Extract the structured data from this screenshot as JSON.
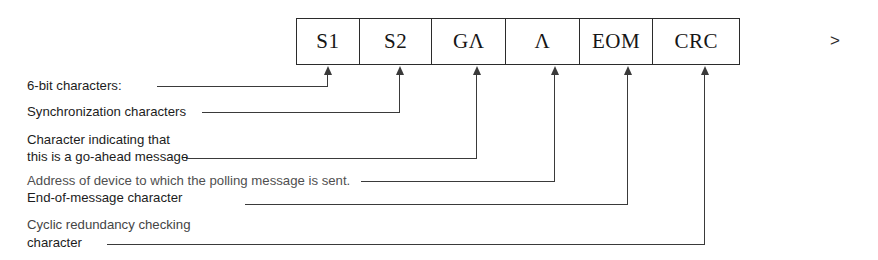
{
  "diagram": {
    "continuation_marker": ">",
    "frame": {
      "cells": [
        {
          "label": "S1",
          "name": "cell-s1"
        },
        {
          "label": "S2",
          "name": "cell-s2"
        },
        {
          "label": "GΛ",
          "name": "cell-ga"
        },
        {
          "label": "Λ",
          "name": "cell-a"
        },
        {
          "label": "EOM",
          "name": "cell-eom"
        },
        {
          "label": "CRC",
          "name": "cell-crc"
        }
      ]
    },
    "annotations": [
      {
        "id": "six-bit-characters",
        "lines": [
          "6-bit characters:"
        ],
        "target_cell": "S1"
      },
      {
        "id": "synchronization-characters",
        "lines": [
          "Synchronization characters"
        ],
        "target_cell": "S2"
      },
      {
        "id": "go-ahead-character",
        "lines": [
          "Character indicating that",
          "this is a go-ahead message"
        ],
        "target_cell": "GΛ"
      },
      {
        "id": "address-of-device",
        "lines": [
          "Address of device to which the polling message is sent."
        ],
        "target_cell": "Λ"
      },
      {
        "id": "end-of-message-character",
        "lines": [
          "End-of-message character"
        ],
        "target_cell": "EOM"
      },
      {
        "id": "cyclic-redundancy-checking",
        "lines": [
          "Cyclic redundancy checking",
          "character"
        ],
        "target_cell": "CRC"
      }
    ]
  }
}
